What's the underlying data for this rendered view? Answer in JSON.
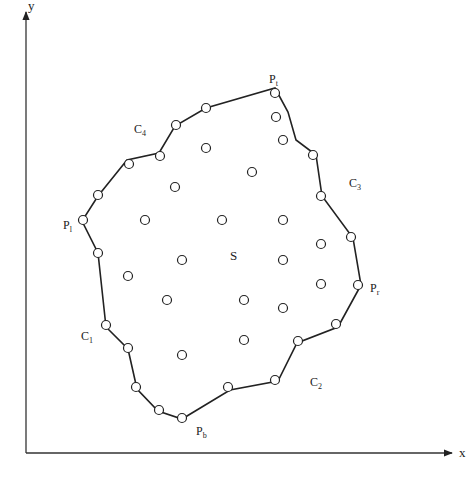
{
  "diagram": {
    "axes": {
      "x_label": "x",
      "y_label": "y",
      "origin": [
        26,
        453
      ],
      "x_end": [
        452,
        453
      ],
      "y_end": [
        26,
        12
      ]
    },
    "region_label": {
      "text": "S",
      "pos": [
        230,
        260
      ]
    },
    "boundary_polygon": [
      [
        275,
        88
      ],
      [
        288,
        112
      ],
      [
        296,
        140
      ],
      [
        316,
        155
      ],
      [
        322,
        196
      ],
      [
        353,
        238
      ],
      [
        361,
        285
      ],
      [
        338,
        327
      ],
      [
        297,
        343
      ],
      [
        278,
        381
      ],
      [
        230,
        390
      ],
      [
        182,
        419
      ],
      [
        158,
        411
      ],
      [
        137,
        389
      ],
      [
        128,
        349
      ],
      [
        106,
        327
      ],
      [
        98,
        253
      ],
      [
        82,
        221
      ],
      [
        98,
        196
      ],
      [
        127,
        160
      ],
      [
        159,
        153
      ],
      [
        175,
        126
      ],
      [
        206,
        108
      ]
    ],
    "boundary_points": [
      [
        275,
        93
      ],
      [
        276,
        117
      ],
      [
        283,
        140
      ],
      [
        313,
        155
      ],
      [
        321,
        196
      ],
      [
        351,
        237
      ],
      [
        358,
        285
      ],
      [
        336,
        324
      ],
      [
        298,
        341
      ],
      [
        275,
        380
      ],
      [
        228,
        387
      ],
      [
        182,
        418
      ],
      [
        159,
        410
      ],
      [
        136,
        387
      ],
      [
        128,
        348
      ],
      [
        106,
        325
      ],
      [
        98,
        253
      ],
      [
        83,
        220
      ],
      [
        98,
        195
      ],
      [
        129,
        164
      ],
      [
        160,
        156
      ],
      [
        176,
        125
      ],
      [
        206,
        108
      ]
    ],
    "interior_points": [
      [
        206,
        148
      ],
      [
        252,
        172
      ],
      [
        175,
        187
      ],
      [
        145,
        220
      ],
      [
        222,
        220
      ],
      [
        283,
        220
      ],
      [
        321,
        244
      ],
      [
        182,
        260
      ],
      [
        283,
        260
      ],
      [
        128,
        276
      ],
      [
        321,
        284
      ],
      [
        167,
        300
      ],
      [
        244,
        300
      ],
      [
        283,
        308
      ],
      [
        244,
        340
      ],
      [
        182,
        355
      ]
    ],
    "labels": [
      {
        "id": "P_t",
        "base": "P",
        "sub": "t",
        "pos": [
          269,
          83
        ]
      },
      {
        "id": "P_l",
        "base": "P",
        "sub": "l",
        "pos": [
          63,
          229
        ]
      },
      {
        "id": "P_r",
        "base": "P",
        "sub": "r",
        "pos": [
          370,
          292
        ]
      },
      {
        "id": "P_b",
        "base": "P",
        "sub": "b",
        "pos": [
          196,
          435
        ]
      },
      {
        "id": "C_1",
        "base": "C",
        "sub": "1",
        "pos": [
          81,
          340
        ]
      },
      {
        "id": "C_2",
        "base": "C",
        "sub": "2",
        "pos": [
          310,
          386
        ]
      },
      {
        "id": "C_3",
        "base": "C",
        "sub": "3",
        "pos": [
          349,
          187
        ]
      },
      {
        "id": "C_4",
        "base": "C",
        "sub": "4",
        "pos": [
          134,
          133
        ]
      }
    ],
    "colors": {
      "line": "#222222",
      "background": "#ffffff"
    }
  }
}
